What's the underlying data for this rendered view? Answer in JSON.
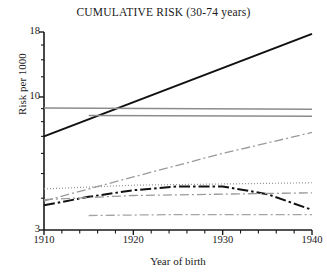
{
  "chart_data": {
    "type": "line",
    "title": "CUMULATIVE RISK (30-74 years)",
    "xlabel": "Year of birth",
    "ylabel": "Risk per 1000",
    "xlim": [
      1910,
      1940
    ],
    "ylim": [
      3,
      18
    ],
    "yscale": "log",
    "grid": false,
    "legend": "none",
    "xticks": [
      1910,
      1920,
      1930,
      1940
    ],
    "xtick_labels": [
      "1910",
      "1920",
      "1930",
      "1940"
    ],
    "xminor_ticks": [
      1912,
      1914,
      1916,
      1918,
      1922,
      1924,
      1926,
      1928,
      1932,
      1934,
      1936,
      1938
    ],
    "yticks": [
      3,
      10,
      18
    ],
    "ytick_labels": [
      "3",
      "10",
      "18"
    ],
    "yminor_ticks": [
      4,
      5,
      6,
      7,
      8,
      9,
      12,
      14,
      16
    ],
    "series": [
      {
        "name": "series-1-thick-solid-rising",
        "style": "solid",
        "color": "#111111",
        "width": 2.1,
        "x": [
          1910,
          1940
        ],
        "values": [
          7.0,
          17.7
        ]
      },
      {
        "name": "series-2-gray-horizontal-upper",
        "style": "solid",
        "color": "#8c8c8c",
        "width": 1.5,
        "x": [
          1910,
          1940
        ],
        "values": [
          9.05,
          8.95
        ]
      },
      {
        "name": "series-3-gray-horizontal-lower",
        "style": "solid",
        "color": "#8c8c8c",
        "width": 1.5,
        "x": [
          1915,
          1940
        ],
        "values": [
          8.45,
          8.4
        ]
      },
      {
        "name": "series-4-gray-dashdot-rising",
        "style": "dashdot",
        "color": "#9a9a9a",
        "width": 1.3,
        "x": [
          1910,
          1920,
          1930,
          1940
        ],
        "values": [
          3.9,
          4.85,
          6.0,
          7.25
        ]
      },
      {
        "name": "series-5-gray-dotted-flat",
        "style": "dotted",
        "color": "#8f8f8f",
        "width": 1.2,
        "x": [
          1910,
          1920,
          1930,
          1940
        ],
        "values": [
          4.35,
          4.5,
          4.55,
          4.6
        ]
      },
      {
        "name": "series-6-black-dashdot-peak",
        "style": "dashdot",
        "color": "#111111",
        "width": 2.0,
        "x": [
          1910,
          1915,
          1920,
          1925,
          1930,
          1935,
          1940
        ],
        "values": [
          3.75,
          4.05,
          4.3,
          4.45,
          4.45,
          4.15,
          3.6
        ]
      },
      {
        "name": "series-7-gray-dashdot-flat",
        "style": "dashdot",
        "color": "#9a9a9a",
        "width": 1.3,
        "x": [
          1910,
          1920,
          1930,
          1940
        ],
        "values": [
          3.95,
          4.1,
          4.15,
          4.2
        ]
      },
      {
        "name": "series-8-gray-dashdot-low",
        "style": "dashdot",
        "color": "#a5a5a5",
        "width": 1.3,
        "x": [
          1915,
          1925,
          1940
        ],
        "values": [
          3.42,
          3.45,
          3.45
        ]
      }
    ]
  },
  "axes": {
    "title": "CUMULATIVE RISK (30-74 years)",
    "ylabel": "Risk per 1000",
    "xlabel": "Year of birth"
  }
}
